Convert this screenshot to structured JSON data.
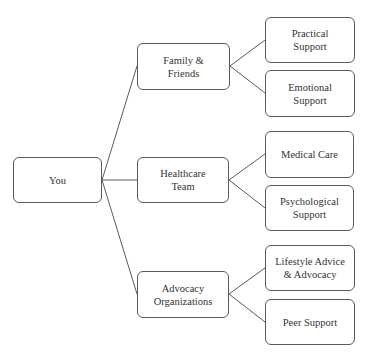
{
  "diagram": {
    "type": "tree",
    "stroke_color": "#5a5a5a",
    "text_color": "#333333",
    "root": {
      "id": "you",
      "label": "You"
    },
    "level1": [
      {
        "id": "family",
        "label": "Family &\nFriends"
      },
      {
        "id": "healthcare",
        "label": "Healthcare\nTeam"
      },
      {
        "id": "advocacy",
        "label": "Advocacy\nOrganizations"
      }
    ],
    "level2": [
      {
        "id": "practical",
        "parent": "family",
        "label": "Practical\nSupport"
      },
      {
        "id": "emotional",
        "parent": "family",
        "label": "Emotional\nSupport"
      },
      {
        "id": "medical",
        "parent": "healthcare",
        "label": "Medical Care"
      },
      {
        "id": "psychological",
        "parent": "healthcare",
        "label": "Psychological\nSupport"
      },
      {
        "id": "lifestyle",
        "parent": "advocacy",
        "label": "Lifestyle Advice\n& Advocacy"
      },
      {
        "id": "peer",
        "parent": "advocacy",
        "label": "Peer Support"
      }
    ],
    "edges": [
      [
        "you",
        "family"
      ],
      [
        "you",
        "healthcare"
      ],
      [
        "you",
        "advocacy"
      ],
      [
        "family",
        "practical"
      ],
      [
        "family",
        "emotional"
      ],
      [
        "healthcare",
        "medical"
      ],
      [
        "healthcare",
        "psychological"
      ],
      [
        "advocacy",
        "lifestyle"
      ],
      [
        "advocacy",
        "peer"
      ]
    ]
  }
}
